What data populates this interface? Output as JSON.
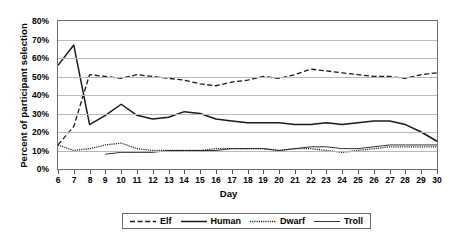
{
  "chart_data": {
    "type": "line",
    "title": "",
    "xlabel": "Day",
    "ylabel": "Percent of participant selection",
    "xlim": [
      6,
      30
    ],
    "ylim": [
      0,
      80
    ],
    "ytick_labels": [
      "80%",
      "70%",
      "60%",
      "50%",
      "40%",
      "30%",
      "20%",
      "10%",
      "0%"
    ],
    "ytick_values": [
      80,
      70,
      60,
      50,
      40,
      30,
      20,
      10,
      0
    ],
    "grid": true,
    "legend_position": "bottom",
    "x": [
      6,
      7,
      8,
      9,
      10,
      11,
      12,
      13,
      14,
      15,
      16,
      17,
      18,
      19,
      20,
      21,
      22,
      23,
      24,
      25,
      26,
      27,
      28,
      29,
      30
    ],
    "categories": [
      "6",
      "7",
      "8",
      "9",
      "10",
      "11",
      "12",
      "13",
      "14",
      "15",
      "16",
      "17",
      "18",
      "19",
      "20",
      "21",
      "22",
      "23",
      "24",
      "25",
      "26",
      "27",
      "28",
      "29",
      "30"
    ],
    "series": [
      {
        "name": "Elf",
        "style": "dashed",
        "values": [
          13,
          23,
          51,
          50,
          49,
          51,
          50,
          49,
          48,
          46,
          45,
          47,
          48,
          50,
          49,
          51,
          54,
          53,
          52,
          51,
          50,
          50,
          49,
          51,
          52
        ]
      },
      {
        "name": "Human",
        "style": "solid-thick",
        "values": [
          56,
          67,
          24,
          29,
          35,
          29,
          27,
          28,
          31,
          30,
          27,
          26,
          25,
          25,
          25,
          24,
          24,
          25,
          24,
          25,
          26,
          26,
          24,
          20,
          15
        ]
      },
      {
        "name": "Dwarf",
        "style": "dotted",
        "values": [
          13,
          10,
          11,
          13,
          14,
          11,
          10,
          10,
          10,
          10,
          11,
          11,
          11,
          11,
          10,
          11,
          11,
          10,
          9,
          10,
          11,
          12,
          12,
          12,
          12
        ]
      },
      {
        "name": "Troll",
        "style": "solid-thin",
        "values": [
          null,
          null,
          null,
          8,
          9,
          9,
          9,
          10,
          10,
          10,
          10,
          11,
          11,
          11,
          10,
          11,
          12,
          12,
          11,
          11,
          12,
          13,
          13,
          13,
          13
        ]
      }
    ]
  },
  "legend": {
    "items": [
      {
        "label": "Elf"
      },
      {
        "label": "Human"
      },
      {
        "label": "Dwarf"
      },
      {
        "label": "Troll"
      }
    ]
  }
}
